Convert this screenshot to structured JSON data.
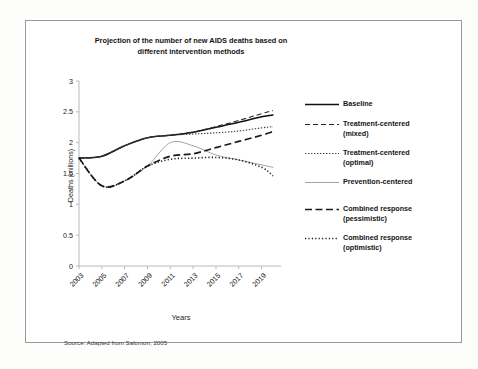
{
  "figure": {
    "title": "Projection of the number of new AIDS deaths based on different intervention methods",
    "title_line1": "Projection of the number of new AIDS deaths based on",
    "title_line2": "different intervention methods",
    "source": "Source: Adapted from Salomon, 2005"
  },
  "chart_data": {
    "type": "line",
    "title": "Projection of the number of new AIDS deaths based on different intervention methods",
    "xlabel": "Years",
    "ylabel": "Deaths (millions)",
    "xlim": [
      2003,
      2020
    ],
    "ylim": [
      0,
      3
    ],
    "ytick_labels": [
      "0",
      "0.5",
      "1",
      "1.5",
      "2",
      "2.5",
      "3"
    ],
    "yticks": [
      0,
      0.5,
      1,
      1.5,
      2,
      2.5,
      3
    ],
    "xtick_labels": [
      "2003",
      "2005",
      "2007",
      "2009",
      "2011",
      "2013",
      "2015",
      "2017",
      "2019"
    ],
    "xticks": [
      2003,
      2005,
      2007,
      2009,
      2011,
      2013,
      2015,
      2017,
      2019
    ],
    "grid": false,
    "legend_position": "right",
    "x": [
      2003,
      2005,
      2007,
      2009,
      2011,
      2013,
      2015,
      2017,
      2019,
      2020
    ],
    "series": [
      {
        "name": "Baseline",
        "style": "solid-thick",
        "color": "#101010",
        "values": [
          1.75,
          1.78,
          1.95,
          2.08,
          2.12,
          2.17,
          2.25,
          2.33,
          2.42,
          2.45
        ]
      },
      {
        "name": "Treatment-centered (mixed)",
        "label_line1": "Treatment-centered",
        "label_line2": "(mixed)",
        "style": "dashed",
        "color": "#262626",
        "values": [
          1.75,
          1.78,
          1.95,
          2.08,
          2.12,
          2.17,
          2.26,
          2.36,
          2.47,
          2.52
        ]
      },
      {
        "name": "Treatment-centered (optimal)",
        "label_line1": "Treatment-centered",
        "label_line2": "(optimal)",
        "style": "dotted",
        "color": "#3c3c3c",
        "values": [
          1.75,
          1.78,
          1.95,
          2.08,
          2.12,
          2.14,
          2.16,
          2.19,
          2.24,
          2.26
        ]
      },
      {
        "name": "Prevention-centered",
        "style": "solid-thin",
        "color": "#8c8c8c",
        "values": [
          1.75,
          1.3,
          1.38,
          1.62,
          2.0,
          1.95,
          1.8,
          1.72,
          1.64,
          1.6
        ]
      },
      {
        "name": "Combined response (pessimistic)",
        "label_line1": "Combined response",
        "label_line2": "(pessimistic)",
        "style": "long-dash-thick",
        "color": "#1a1a1a",
        "values": [
          1.75,
          1.3,
          1.38,
          1.62,
          1.78,
          1.82,
          1.92,
          2.02,
          2.12,
          2.18
        ]
      },
      {
        "name": "Combined response (optimistic)",
        "label_line1": "Combined response",
        "label_line2": "(optimistic)",
        "style": "fine-dotted",
        "color": "#1a1a1a",
        "values": [
          1.75,
          1.3,
          1.38,
          1.62,
          1.73,
          1.75,
          1.76,
          1.72,
          1.6,
          1.46
        ]
      }
    ]
  }
}
